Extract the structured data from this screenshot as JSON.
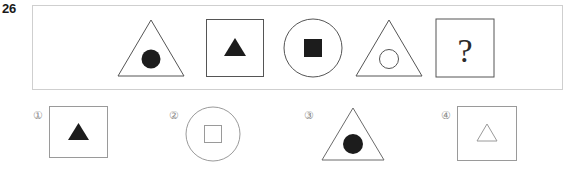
{
  "question": {
    "number": "26",
    "type": "figure-matrix-analogy"
  },
  "stem": {
    "panel_border_color": "#cfcfcf",
    "cells": [
      {
        "index": 1,
        "outer_shape": "triangle",
        "outer_style": "outline",
        "inner_shape": "circle",
        "inner_style": "filled",
        "description": "outline triangle containing filled circle"
      },
      {
        "index": 2,
        "outer_shape": "square",
        "outer_style": "outline",
        "inner_shape": "triangle",
        "inner_style": "filled",
        "description": "outline square containing filled triangle"
      },
      {
        "index": 3,
        "outer_shape": "circle",
        "outer_style": "outline",
        "inner_shape": "square",
        "inner_style": "filled",
        "description": "outline circle containing filled square"
      },
      {
        "index": 4,
        "outer_shape": "triangle",
        "outer_style": "outline",
        "inner_shape": "circle",
        "inner_style": "outline",
        "description": "outline triangle containing outline circle"
      },
      {
        "index": 5,
        "outer_shape": "square",
        "outer_style": "outline",
        "inner_shape": "question-mark",
        "inner_style": "text",
        "inner_text": "?",
        "description": "outline square containing a question mark"
      }
    ]
  },
  "options": [
    {
      "label": "①",
      "number": "1",
      "outer_shape": "square",
      "outer_style": "outline",
      "inner_shape": "triangle",
      "inner_style": "filled",
      "description": "outline square containing filled triangle"
    },
    {
      "label": "②",
      "number": "2",
      "outer_shape": "circle",
      "outer_style": "outline",
      "inner_shape": "square",
      "inner_style": "outline",
      "description": "outline circle containing outline square"
    },
    {
      "label": "③",
      "number": "3",
      "outer_shape": "triangle",
      "outer_style": "outline",
      "inner_shape": "circle",
      "inner_style": "filled",
      "description": "outline triangle containing filled circle"
    },
    {
      "label": "④",
      "number": "4",
      "outer_shape": "square",
      "outer_style": "outline",
      "inner_shape": "triangle",
      "inner_style": "outline",
      "description": "outline square containing small outline triangle"
    }
  ],
  "colors": {
    "stroke": "#555555",
    "panel_stroke": "#cfcfcf",
    "fill_dark": "#1c1c1c",
    "label_gray": "#8a8a8a",
    "number_dark": "#1a1a1a",
    "background": "#ffffff"
  }
}
